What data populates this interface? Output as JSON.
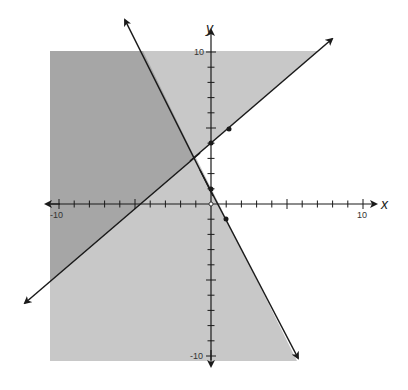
{
  "chart_data": {
    "type": "line",
    "title": "",
    "xlabel": "x",
    "ylabel": "y",
    "xlim": [
      -10,
      10
    ],
    "ylim": [
      -10,
      10
    ],
    "grid": false,
    "tick_labels": {
      "x": [
        "-10",
        "10"
      ],
      "y": [
        "10",
        "-10"
      ]
    },
    "series": [
      {
        "name": "steep line (decreasing)",
        "equation": "y = -2x + 1",
        "marked_points": [
          [
            0,
            1
          ],
          [
            1,
            -1
          ]
        ],
        "shading": "left / below"
      },
      {
        "name": "rising line (increasing)",
        "equation": "y ≈ 0.86x + 4",
        "marked_points": [
          [
            0,
            4
          ],
          [
            1.2,
            5
          ]
        ],
        "shading": "above"
      }
    ],
    "intersection": [
      -1.05,
      3.0
    ],
    "regions": [
      {
        "name": "overlap (both inequalities)",
        "color": "#a6a6a6"
      },
      {
        "name": "single inequality",
        "color": "#c8c8c8"
      },
      {
        "name": "neither",
        "color": "#ffffff"
      }
    ],
    "origin_marker": "open circle"
  },
  "labels": {
    "x_axis": "x",
    "y_axis": "y",
    "x_min": "-10",
    "x_max": "10",
    "y_max": "10",
    "y_min": "-10"
  },
  "colors": {
    "dark_region": "#a6a6a6",
    "light_region": "#c8c8c8",
    "line": "#1a1a1a"
  }
}
